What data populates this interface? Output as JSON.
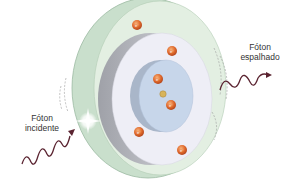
{
  "diagram": {
    "type": "atom-photon-scattering",
    "labels": {
      "incident": [
        "Fóton",
        "incidente"
      ],
      "scattered": [
        "Fóton",
        "espalhado"
      ]
    },
    "electron_symbol": "e⁻",
    "electron_count": 7,
    "colors": {
      "outer_shell": "#dcebdc",
      "outer_shell_edge": "#a8c5ad",
      "middle_shell": "#eeeef6",
      "middle_shell_side": "#b9bac0",
      "inner_core": "#c7d6ea",
      "electron": "#e06a2c",
      "nucleus": "#d8b45a",
      "wave": "#5a2330"
    }
  }
}
